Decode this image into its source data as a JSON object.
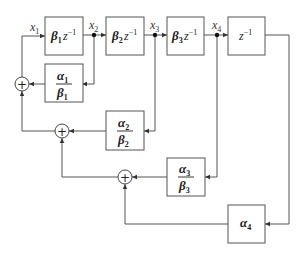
{
  "diagram": {
    "type": "signal-flow block diagram",
    "nodes": [
      {
        "id": "x1",
        "label": "x",
        "sub": "1"
      },
      {
        "id": "x2",
        "label": "x",
        "sub": "2"
      },
      {
        "id": "x3",
        "label": "x",
        "sub": "3"
      },
      {
        "id": "x4",
        "label": "x",
        "sub": "4"
      }
    ],
    "forward_blocks": [
      {
        "id": "b1",
        "coef": "β",
        "sub": "1",
        "delay": "z",
        "exp": "−1"
      },
      {
        "id": "b2",
        "coef": "β",
        "sub": "2",
        "delay": "z",
        "exp": "−1"
      },
      {
        "id": "b3",
        "coef": "β",
        "sub": "3",
        "delay": "z",
        "exp": "−1"
      },
      {
        "id": "b4",
        "coef": "",
        "sub": "",
        "delay": "z",
        "exp": "−1"
      }
    ],
    "feedback_blocks": [
      {
        "id": "f1",
        "num": "α",
        "num_sub": "1",
        "den": "β",
        "den_sub": "1"
      },
      {
        "id": "f2",
        "num": "α",
        "num_sub": "2",
        "den": "β",
        "den_sub": "2"
      },
      {
        "id": "f3",
        "num": "α",
        "num_sub": "3",
        "den": "β",
        "den_sub": "3"
      },
      {
        "id": "f4",
        "num": "α",
        "num_sub": "4",
        "den": "",
        "den_sub": ""
      }
    ],
    "summers": [
      {
        "id": "s1",
        "symbol": "+"
      },
      {
        "id": "s2",
        "symbol": "+"
      },
      {
        "id": "s3",
        "symbol": "+"
      }
    ],
    "colors": {
      "line": "#555555",
      "text": "#222222",
      "background": "#ffffff"
    }
  }
}
